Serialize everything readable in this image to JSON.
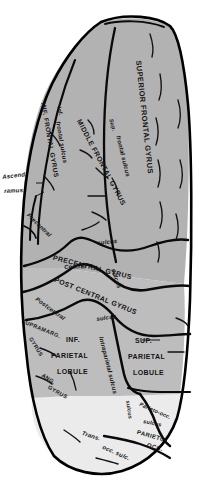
{
  "figure": {
    "kind": "anatomical-illustration",
    "palette": {
      "frontal_fill": "#b2b2b2",
      "parietal_fill": "#bdbdbd",
      "occipital_fill": "#ebebeb",
      "outline": "#000000",
      "sulcus_line": "#0a0a0a",
      "label_color": "#141414",
      "background": "#ffffff"
    }
  },
  "labels": {
    "superior_frontal_gyrus": "SUPERIOR FRONTAL GYRUS",
    "middle_frontal_gyrus": "MIDDLE FRONTAL GYRUS",
    "inferior_frontal_gyrus": "Inf. FRONTAL GYRUS",
    "superior_frontal_sulcus_sup": "Sup.",
    "superior_frontal_sulcus_rest": "frontal sulcus",
    "inferior_frontal_sulcus_inf": "Inf.",
    "inferior_frontal_sulcus_rest": "frontal sulcus",
    "ascending_ramus_line1": "Ascend.",
    "ascending_ramus_line2": "ramus",
    "precentral_sulcus_left": "Precentral",
    "precentral_sulcus_right": "sulcus",
    "precentral_gyrus": "PRECENTRAL GYRUS",
    "central_sulcus_central": "Central",
    "central_sulcus_sulcus": "sulcus",
    "postcentral_gyrus": "POST CENTRAL GYRUS",
    "postcentral_sulcus_left": "Postcentral",
    "postcentral_sulcus_right": "sulcus",
    "supramarginal_gyrus_line1": "SUPRAMARG.",
    "supramarginal_gyrus_line2": "GYRUS",
    "inferior_parietal_lobule_line1": "INF.",
    "inferior_parietal_lobule_line2": "PARIETAL",
    "inferior_parietal_lobule_line3": "LOBULE",
    "intraparietal_sulcus": "Intraparietal sulcus",
    "superior_parietal_lobule_line1": "SUP.",
    "superior_parietal_lobule_line2": "PARIETAL",
    "superior_parietal_lobule_line3": "LOBULE",
    "angular_gyrus_line1": "ANG.",
    "angular_gyrus_line2": "GYRUS",
    "parieto_occipital_sulcus_vertical": "sulcus",
    "parieto_occipital_sulcus_label": "Parieto-occ.",
    "parieto_occipital_sulcus_word": "sulcus",
    "parieto_occipital_region_line1": "PARIETO-",
    "parieto_occipital_region_line2": "OCC.",
    "transverse_occipital_sulcus_trans": "Trans.",
    "transverse_occipital_sulcus_rest": "occ. sulc."
  }
}
